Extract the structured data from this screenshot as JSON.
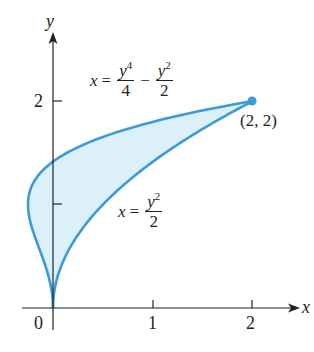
{
  "figure": {
    "axes": {
      "x_label": "x",
      "y_label": "y",
      "x_ticks": [
        "0",
        "1",
        "2"
      ],
      "y_ticks": [
        "2"
      ]
    },
    "curves": [
      {
        "name": "quartic",
        "equation_lhs": "x",
        "equation_eq": "=",
        "term1_num_base": "y",
        "term1_num_exp": "4",
        "term1_den": "4",
        "operator": "−",
        "term2_num_base": "y",
        "term2_num_exp": "2",
        "term2_den": "2"
      },
      {
        "name": "parabola",
        "equation_lhs": "x",
        "equation_eq": "=",
        "num_base": "y",
        "num_exp": "2",
        "den": "2"
      }
    ],
    "point_label": "(2, 2)",
    "colors": {
      "curve": "#3d9ad9",
      "fill": "#dcf0fa",
      "axis": "#222222"
    }
  },
  "chart_data": {
    "type": "area",
    "title": "",
    "xlabel": "x",
    "ylabel": "y",
    "xlim": [
      0,
      2.3
    ],
    "ylim": [
      0,
      2.6
    ],
    "x_ticks": [
      0,
      1,
      2
    ],
    "y_ticks": [
      1,
      2
    ],
    "series": [
      {
        "name": "x = y^4/4 - y^2/2",
        "y": [
          0,
          0.5,
          1.0,
          1.5,
          2.0
        ],
        "x": [
          0,
          -0.109,
          -0.25,
          0.141,
          2.0
        ]
      },
      {
        "name": "x = y^2/2",
        "y": [
          0,
          0.5,
          1.0,
          1.5,
          2.0
        ],
        "x": [
          0,
          0.125,
          0.5,
          1.125,
          2.0
        ]
      }
    ],
    "region": "shaded between x = y^4/4 - y^2/2 and x = y^2/2 for 0 ≤ y ≤ 2",
    "annotations": [
      "(2, 2)",
      "x = y^4/4 - y^2/2",
      "x = y^2/2"
    ],
    "grid": false
  }
}
